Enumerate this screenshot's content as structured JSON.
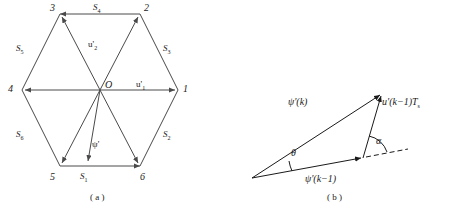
{
  "figure": {
    "panel_a": {
      "caption": "( a )",
      "center_label": "O",
      "vertices": [
        {
          "id": "v1",
          "label": "1"
        },
        {
          "id": "v2",
          "label": "2"
        },
        {
          "id": "v3",
          "label": "3"
        },
        {
          "id": "v4",
          "label": "4"
        },
        {
          "id": "v5",
          "label": "5"
        },
        {
          "id": "v6",
          "label": "6"
        }
      ],
      "sectors": [
        {
          "id": "s1",
          "base": "S",
          "sub": "1"
        },
        {
          "id": "s2",
          "base": "S",
          "sub": "2"
        },
        {
          "id": "s3",
          "base": "S",
          "sub": "3"
        },
        {
          "id": "s4",
          "base": "S",
          "sub": "4"
        },
        {
          "id": "s5",
          "base": "S",
          "sub": "5"
        },
        {
          "id": "s6",
          "base": "S",
          "sub": "6"
        }
      ],
      "vectors": [
        {
          "id": "u1",
          "base": "u'",
          "sub": "1"
        },
        {
          "id": "u2",
          "base": "u'",
          "sub": "2"
        },
        {
          "id": "psi",
          "base": "ψ'",
          "sub": ""
        }
      ]
    },
    "panel_b": {
      "caption": "( b )",
      "labels": {
        "psi_k": "ψ'(k)",
        "psi_k_minus_1": "ψ'(k−1)",
        "u_k_minus_1_ts_base": "u'(k−1)T",
        "u_k_minus_1_ts_sub": "s",
        "theta": "θ",
        "alpha": "α"
      }
    }
  },
  "colors": {
    "line": "#4a4a4a",
    "text": "#1a1a1a",
    "background": "#ffffff"
  }
}
